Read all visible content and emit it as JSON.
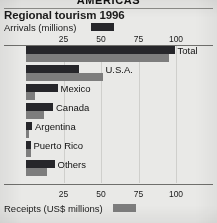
{
  "banner": {
    "section_title": "AMERICAS"
  },
  "header": {
    "title": "Regional tourism 1996",
    "arrivals_legend_label": "Arrivals (millions)",
    "receipts_legend_label": "Receipts (US$ millions)"
  },
  "colors": {
    "arrivals": "#26262a",
    "receipts": "#7d7d7d",
    "background": "#e9e9e7",
    "gridline": "#cfcfcc",
    "axis": "#6f6f6c"
  },
  "chart_data": {
    "type": "bar",
    "title": "Regional tourism 1996",
    "orientation": "horizontal",
    "categories": [
      "Total",
      "U.S.A.",
      "Mexico",
      "Canada",
      "Argentina",
      "Puerto Rico",
      "Others"
    ],
    "series": [
      {
        "name": "Arrivals (millions)",
        "values": [
          99,
          35,
          21,
          18,
          4,
          3,
          19
        ]
      },
      {
        "name": "Receipts (US$ millions)",
        "values": [
          95,
          51,
          6,
          12,
          2,
          3,
          14
        ]
      }
    ],
    "xlabel_top": "Arrivals (millions)",
    "xlabel_bottom": "Receipts (US$ millions)",
    "ylabel": "",
    "xlim": [
      0,
      110
    ],
    "ticks": [
      25,
      50,
      75,
      100
    ],
    "tick_labels": [
      "25",
      "50",
      "75",
      "100"
    ],
    "grid": true,
    "legend_position": "inline-with-axis-labels"
  }
}
